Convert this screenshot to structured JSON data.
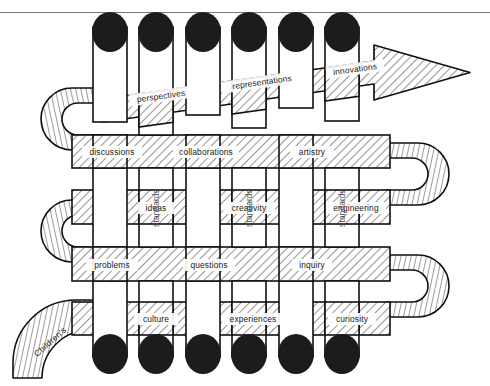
{
  "page": {
    "header_fragment": "",
    "width": 490,
    "height": 386,
    "background": "#ffffff",
    "ink": "#111111",
    "cap_color": "#1c1c1c",
    "hatch_color": "#3a3a3a"
  },
  "diagram": {
    "tail_label": "Children's",
    "arrow_direction": "right",
    "horizontal_strips": [
      {
        "row": 1,
        "style": "arrow",
        "labels": [
          "perspectives",
          "representations",
          "innovations"
        ]
      },
      {
        "row": 2,
        "style": "u-turn-left",
        "labels": [
          "discussions",
          "collaborations",
          "artistry"
        ]
      },
      {
        "row": 3,
        "style": "u-turn-both",
        "labels": [
          "ideas",
          "creativity",
          "engineering"
        ]
      },
      {
        "row": 4,
        "style": "u-turn-left",
        "labels": [
          "problems",
          "questions",
          "inquiry"
        ]
      },
      {
        "row": 5,
        "style": "tail-left-u-turn-right",
        "labels": [
          "culture",
          "experiences",
          "curiosity"
        ]
      }
    ],
    "vertical_strips": [
      {
        "index": 1,
        "label": ""
      },
      {
        "index": 2,
        "label": "standards"
      },
      {
        "index": 3,
        "label": ""
      },
      {
        "index": 4,
        "label": "standards"
      },
      {
        "index": 5,
        "label": ""
      },
      {
        "index": 6,
        "label": "standards"
      }
    ],
    "vertical_labels_visible": [
      "standards",
      "standards",
      "standards"
    ],
    "cap_count_top": 6,
    "cap_count_bottom": 6
  }
}
